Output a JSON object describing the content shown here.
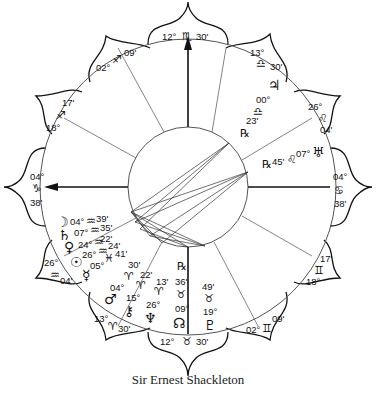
{
  "title": "Sir Ernest Shackleton",
  "colors": {
    "ink": "#111111",
    "line": "#555555",
    "background": "#ffffff"
  },
  "angles": {
    "mc": {
      "degree": "12°",
      "sign": "scorpio",
      "glyph": "♏",
      "minute": "30'"
    },
    "ic": {
      "degree": "12°",
      "sign": "taurus",
      "glyph": "♉",
      "minute": "30'"
    },
    "asc": {
      "degree": "04°",
      "sign": "capricorn",
      "glyph": "♑",
      "minute": "38'"
    },
    "dsc": {
      "degree": "04°",
      "sign": "cancer",
      "glyph": "♋",
      "minute": "38'"
    }
  },
  "house_cusps": [
    {
      "id": "cusp-11",
      "degree": "13°",
      "glyph": "♎",
      "minute": "30'"
    },
    {
      "id": "cusp-12",
      "degree": "26°",
      "glyph": "♌",
      "minute": "04'"
    },
    {
      "id": "cusp-2",
      "degree": "17'",
      "glyph": "♊",
      "minute": "18°"
    },
    {
      "id": "cusp-3",
      "degree": "02°",
      "glyph": "♊",
      "minute": "09'"
    },
    {
      "id": "cusp-5",
      "degree": "13°",
      "glyph": "♈",
      "minute": "30'"
    },
    {
      "id": "cusp-6",
      "degree": "26°",
      "glyph": "♒",
      "minute": "04'"
    },
    {
      "id": "cusp-8",
      "degree": "18°",
      "glyph": "♐",
      "minute": "17'"
    },
    {
      "id": "cusp-9",
      "degree": "02°",
      "glyph": "♐",
      "minute": "09'"
    }
  ],
  "planets": [
    {
      "name": "jupiter",
      "glyph": "♃",
      "degree": "00°",
      "sign_glyph": "♎",
      "minute": "23'",
      "retrograde": "℞"
    },
    {
      "name": "uranus",
      "glyph": "♅",
      "degree": "07°",
      "sign_glyph": "♌",
      "minute": "45'",
      "retrograde": "℞"
    },
    {
      "name": "moon",
      "glyph": "☽",
      "degree": "04°",
      "sign_glyph": "♒",
      "minute": "39'"
    },
    {
      "name": "saturn",
      "glyph": "♄",
      "degree": "07°",
      "sign_glyph": "♒",
      "minute": "35'"
    },
    {
      "name": "venus",
      "glyph": "♀",
      "degree": "24°",
      "sign_glyph": "♒",
      "minute": "22'"
    },
    {
      "name": "sun",
      "glyph": "☉",
      "degree": "26°",
      "sign_glyph": "♒",
      "minute": "24'"
    },
    {
      "name": "mercury",
      "glyph": "☿",
      "degree": "05°",
      "sign_glyph": "♓",
      "minute": "41'"
    },
    {
      "name": "mars",
      "glyph": "♂",
      "degree": "04°",
      "sign_glyph": "♈",
      "minute": "30'"
    },
    {
      "name": "chiron",
      "glyph": "⚷",
      "degree": "15°",
      "sign_glyph": "♈",
      "minute": "22'"
    },
    {
      "name": "neptune",
      "glyph": "♆",
      "degree": "26°",
      "sign_glyph": "♈",
      "minute": "13'"
    },
    {
      "name": "north-node",
      "glyph": "☊",
      "degree": "09°",
      "sign_glyph": "♉",
      "minute": "36'",
      "retrograde": "℞"
    },
    {
      "name": "pluto",
      "glyph": "♇",
      "degree": "19°",
      "sign_glyph": "♉",
      "minute": "49'"
    }
  ]
}
